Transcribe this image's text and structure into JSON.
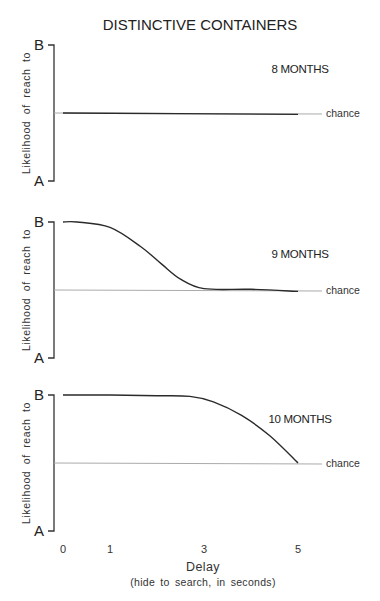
{
  "chart_data": {
    "type": "line",
    "title": "DISTINCTIVE CONTAINERS",
    "xlabel": "Delay",
    "xlabel_sub": "(hide to search, in seconds)",
    "ylabel": "Likelihood of reach to",
    "y_top_label": "B",
    "y_bottom_label": "A",
    "ylim": [
      0,
      1
    ],
    "xlim": [
      0,
      5
    ],
    "x_ticks": [
      0,
      1,
      3,
      5
    ],
    "x_tick_labels": [
      "0",
      "1",
      "3",
      "5"
    ],
    "chance_level": 0.5,
    "chance_label": "chance",
    "grid": false,
    "panels": [
      {
        "label": "8 MONTHS",
        "series": [
          {
            "name": "8 months",
            "x": [
              0,
              5
            ],
            "y": [
              0.5,
              0.49
            ]
          }
        ]
      },
      {
        "label": "9 MONTHS",
        "series": [
          {
            "name": "9 months",
            "x": [
              0,
              0.3,
              1,
              1.65,
              2.1,
              2.5,
              3.0,
              4.0,
              5.0
            ],
            "y": [
              1.0,
              1.0,
              0.96,
              0.82,
              0.69,
              0.58,
              0.51,
              0.505,
              0.49
            ]
          }
        ]
      },
      {
        "label": "10 MONTHS",
        "series": [
          {
            "name": "10 months",
            "x": [
              0,
              1,
              2,
              2.7,
              3.2,
              3.8,
              4.4,
              5.0
            ],
            "y": [
              1.0,
              1.0,
              0.995,
              0.99,
              0.95,
              0.85,
              0.7,
              0.5
            ]
          }
        ]
      }
    ]
  }
}
